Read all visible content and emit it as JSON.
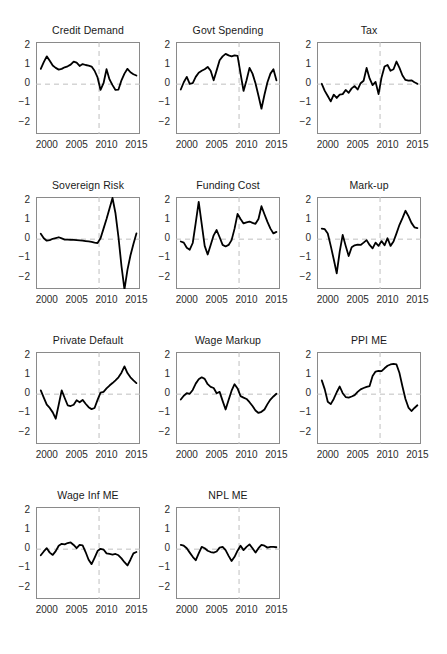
{
  "figure": {
    "type": "small-multiples-line-grid",
    "rows": 4,
    "cols": 3,
    "panel_count": 11,
    "line_color": "#000000",
    "reference_line_color": "#bfbfbf",
    "axis_color": "#8a8a8a",
    "background": "#ffffff"
  },
  "axes": {
    "ylim": [
      -2.6,
      2.2
    ],
    "yticks": [
      2,
      1,
      0,
      -1,
      -2
    ],
    "ytick_labels": [
      "2",
      "1",
      "0",
      "−1",
      "−2"
    ],
    "xlim": [
      1998.2,
      2015.6
    ],
    "xticks": [
      2000,
      2005,
      2010,
      2015
    ],
    "xtick_labels": [
      "2000",
      "2005",
      "2010",
      "2015"
    ],
    "zero_line": 0,
    "vertical_marker_x": 2008.75,
    "grid": false,
    "legend": null
  },
  "chart_data": [
    {
      "type": "line",
      "title": "Credit Demand",
      "xlabel": "",
      "ylabel": "",
      "ylim": [
        -2.6,
        2.2
      ],
      "x": [
        1999,
        1999.5,
        2000,
        2000.5,
        2001,
        2001.5,
        2002,
        2002.5,
        2003,
        2003.5,
        2004,
        2004.5,
        2005,
        2005.5,
        2006,
        2006.5,
        2007,
        2007.5,
        2008,
        2008.5,
        2009,
        2009.5,
        2010,
        2010.5,
        2011,
        2011.5,
        2012,
        2012.5,
        2013,
        2013.5,
        2014,
        2014.5,
        2015
      ],
      "values": [
        0.8,
        1.15,
        1.45,
        1.22,
        0.97,
        0.85,
        0.76,
        0.8,
        0.88,
        0.93,
        1.02,
        1.18,
        1.12,
        0.95,
        1.05,
        1.0,
        0.97,
        0.92,
        0.7,
        0.35,
        -0.3,
        0.05,
        0.78,
        0.25,
        -0.05,
        -0.3,
        -0.28,
        0.2,
        0.55,
        0.8,
        0.62,
        0.52,
        0.45
      ]
    },
    {
      "type": "line",
      "title": "Govt Spending",
      "xlabel": "",
      "ylabel": "",
      "ylim": [
        -2.6,
        2.2
      ],
      "x": [
        1999,
        1999.5,
        2000,
        2000.5,
        2001,
        2001.5,
        2002,
        2002.5,
        2003,
        2003.5,
        2004,
        2004.5,
        2005,
        2005.5,
        2006,
        2006.5,
        2007,
        2007.5,
        2008,
        2008.5,
        2009,
        2009.5,
        2010,
        2010.5,
        2011,
        2011.5,
        2012,
        2012.5,
        2013,
        2013.5,
        2014,
        2014.5,
        2015
      ],
      "values": [
        -0.28,
        0.1,
        0.38,
        0.02,
        0.05,
        0.38,
        0.6,
        0.7,
        0.78,
        0.9,
        0.7,
        0.2,
        0.72,
        1.25,
        1.45,
        1.58,
        1.5,
        1.45,
        1.5,
        1.48,
        0.55,
        -0.35,
        0.2,
        0.85,
        0.55,
        0.05,
        -0.6,
        -1.28,
        -0.55,
        0.1,
        0.55,
        0.78,
        0.2
      ]
    },
    {
      "type": "line",
      "title": "Tax",
      "xlabel": "",
      "ylabel": "",
      "ylim": [
        -2.6,
        2.2
      ],
      "x": [
        1999,
        1999.5,
        2000,
        2000.5,
        2001,
        2001.5,
        2002,
        2002.5,
        2003,
        2003.5,
        2004,
        2004.5,
        2005,
        2005.5,
        2006,
        2006.5,
        2007,
        2007.5,
        2008,
        2008.5,
        2009,
        2009.5,
        2010,
        2010.5,
        2011,
        2011.5,
        2012,
        2012.5,
        2013,
        2013.5,
        2014,
        2014.5,
        2015
      ],
      "values": [
        0.02,
        -0.35,
        -0.62,
        -0.9,
        -0.55,
        -0.72,
        -0.55,
        -0.52,
        -0.3,
        -0.45,
        -0.22,
        -0.1,
        -0.28,
        0.05,
        0.18,
        0.85,
        0.3,
        -0.05,
        0.12,
        -0.52,
        0.35,
        0.92,
        1.0,
        0.7,
        0.78,
        1.18,
        0.85,
        0.45,
        0.22,
        0.18,
        0.2,
        0.1,
        0.02
      ]
    },
    {
      "type": "line",
      "title": "Sovereign Risk",
      "xlabel": "",
      "ylabel": "",
      "ylim": [
        -2.6,
        2.2
      ],
      "x": [
        1999,
        1999.5,
        2000,
        2000.5,
        2001,
        2001.5,
        2002,
        2002.5,
        2003,
        2003.5,
        2004,
        2004.5,
        2005,
        2005.5,
        2006,
        2006.5,
        2007,
        2007.5,
        2008,
        2008.5,
        2009,
        2009.5,
        2010,
        2010.5,
        2011,
        2011.5,
        2012,
        2012.5,
        2013,
        2013.5,
        2014,
        2014.5,
        2015
      ],
      "values": [
        0.28,
        0.05,
        -0.08,
        -0.05,
        0.02,
        0.06,
        0.1,
        0.04,
        -0.02,
        -0.02,
        -0.03,
        -0.04,
        -0.05,
        -0.06,
        -0.08,
        -0.1,
        -0.12,
        -0.14,
        -0.18,
        -0.2,
        0.05,
        0.55,
        1.05,
        1.6,
        2.15,
        1.35,
        0.1,
        -1.4,
        -2.62,
        -1.6,
        -0.85,
        -0.25,
        0.3
      ]
    },
    {
      "type": "line",
      "title": "Funding Cost",
      "xlabel": "",
      "ylabel": "",
      "ylim": [
        -2.6,
        2.2
      ],
      "x": [
        1999,
        1999.5,
        2000,
        2000.5,
        2001,
        2001.5,
        2002,
        2002.5,
        2003,
        2003.5,
        2004,
        2004.5,
        2005,
        2005.5,
        2006,
        2006.5,
        2007,
        2007.5,
        2008,
        2008.5,
        2009,
        2009.5,
        2010,
        2010.5,
        2011,
        2011.5,
        2012,
        2012.5,
        2013,
        2013.5,
        2014,
        2014.5,
        2015
      ],
      "values": [
        -0.12,
        -0.18,
        -0.45,
        -0.55,
        -0.2,
        0.85,
        1.95,
        0.8,
        -0.35,
        -0.8,
        -0.3,
        0.2,
        0.48,
        0.1,
        -0.3,
        -0.38,
        -0.3,
        -0.05,
        0.55,
        1.32,
        1.05,
        0.82,
        0.88,
        0.92,
        0.85,
        0.8,
        1.05,
        1.72,
        1.3,
        0.9,
        0.55,
        0.3,
        0.38
      ]
    },
    {
      "type": "line",
      "title": "Mark-up",
      "xlabel": "",
      "ylabel": "",
      "ylim": [
        -2.6,
        2.2
      ],
      "x": [
        1999,
        1999.5,
        2000,
        2000.5,
        2001,
        2001.5,
        2002,
        2002.5,
        2003,
        2003.5,
        2004,
        2004.5,
        2005,
        2005.5,
        2006,
        2006.5,
        2007,
        2007.5,
        2008,
        2008.5,
        2009,
        2009.5,
        2010,
        2010.5,
        2011,
        2011.5,
        2012,
        2012.5,
        2013,
        2013.5,
        2014,
        2014.5,
        2015
      ],
      "values": [
        0.55,
        0.52,
        0.3,
        -0.35,
        -1.05,
        -1.78,
        -0.65,
        0.22,
        -0.35,
        -0.88,
        -0.42,
        -0.32,
        -0.28,
        -0.3,
        -0.18,
        -0.05,
        -0.3,
        -0.48,
        -0.18,
        -0.35,
        -0.1,
        -0.32,
        0.05,
        -0.35,
        -0.12,
        0.3,
        0.75,
        1.1,
        1.48,
        1.2,
        0.85,
        0.62,
        0.58
      ]
    },
    {
      "type": "line",
      "title": "Private Default",
      "xlabel": "",
      "ylabel": "",
      "ylim": [
        -2.6,
        2.2
      ],
      "x": [
        1999,
        1999.5,
        2000,
        2000.5,
        2001,
        2001.5,
        2002,
        2002.5,
        2003,
        2003.5,
        2004,
        2004.5,
        2005,
        2005.5,
        2006,
        2006.5,
        2007,
        2007.5,
        2008,
        2008.5,
        2009,
        2009.5,
        2010,
        2010.5,
        2011,
        2011.5,
        2012,
        2012.5,
        2013,
        2013.5,
        2014,
        2014.5,
        2015
      ],
      "values": [
        0.2,
        -0.18,
        -0.55,
        -0.72,
        -0.95,
        -1.28,
        -0.55,
        0.2,
        -0.2,
        -0.58,
        -0.62,
        -0.55,
        -0.32,
        -0.42,
        -0.3,
        -0.5,
        -0.68,
        -0.78,
        -0.72,
        -0.3,
        0.08,
        0.12,
        0.3,
        0.45,
        0.58,
        0.72,
        0.88,
        1.12,
        1.45,
        1.1,
        0.88,
        0.72,
        0.58
      ]
    },
    {
      "type": "line",
      "title": "Wage Markup",
      "xlabel": "",
      "ylabel": "",
      "ylim": [
        -2.6,
        2.2
      ],
      "x": [
        1999,
        1999.5,
        2000,
        2000.5,
        2001,
        2001.5,
        2002,
        2002.5,
        2003,
        2003.5,
        2004,
        2004.5,
        2005,
        2005.5,
        2006,
        2006.5,
        2007,
        2007.5,
        2008,
        2008.5,
        2009,
        2009.5,
        2010,
        2010.5,
        2011,
        2011.5,
        2012,
        2012.5,
        2013,
        2013.5,
        2014,
        2014.5,
        2015
      ],
      "values": [
        -0.28,
        -0.08,
        0.05,
        0.02,
        0.22,
        0.55,
        0.78,
        0.88,
        0.8,
        0.52,
        0.38,
        0.32,
        0.05,
        0.12,
        -0.35,
        -0.8,
        -0.3,
        0.18,
        0.52,
        0.3,
        -0.1,
        -0.18,
        -0.25,
        -0.42,
        -0.62,
        -0.85,
        -0.98,
        -0.92,
        -0.8,
        -0.52,
        -0.28,
        -0.12,
        0.02
      ]
    },
    {
      "type": "line",
      "title": "PPI ME",
      "xlabel": "",
      "ylabel": "",
      "ylim": [
        -2.6,
        2.2
      ],
      "x": [
        1999,
        1999.5,
        2000,
        2000.5,
        2001,
        2001.5,
        2002,
        2002.5,
        2003,
        2003.5,
        2004,
        2004.5,
        2005,
        2005.5,
        2006,
        2006.5,
        2007,
        2007.5,
        2008,
        2008.5,
        2009,
        2009.5,
        2010,
        2010.5,
        2011,
        2011.5,
        2012,
        2012.5,
        2013,
        2013.5,
        2014,
        2014.5,
        2015
      ],
      "values": [
        0.72,
        0.25,
        -0.4,
        -0.52,
        -0.25,
        0.1,
        0.4,
        0.05,
        -0.15,
        -0.18,
        -0.12,
        -0.05,
        0.12,
        0.25,
        0.32,
        0.38,
        0.42,
        0.95,
        1.18,
        1.22,
        1.2,
        1.35,
        1.48,
        1.55,
        1.58,
        1.55,
        1.1,
        0.4,
        -0.25,
        -0.7,
        -0.88,
        -0.72,
        -0.58
      ]
    },
    {
      "type": "line",
      "title": "Wage Inf ME",
      "xlabel": "",
      "ylabel": "",
      "ylim": [
        -2.6,
        2.2
      ],
      "x": [
        1999,
        1999.5,
        2000,
        2000.5,
        2001,
        2001.5,
        2002,
        2002.5,
        2003,
        2003.5,
        2004,
        2004.5,
        2005,
        2005.5,
        2006,
        2006.5,
        2007,
        2007.5,
        2008,
        2008.5,
        2009,
        2009.5,
        2010,
        2010.5,
        2011,
        2011.5,
        2012,
        2012.5,
        2013,
        2013.5,
        2014,
        2014.5,
        2015
      ],
      "values": [
        -0.32,
        -0.12,
        0.05,
        -0.18,
        -0.3,
        -0.1,
        0.18,
        0.28,
        0.25,
        0.32,
        0.35,
        0.22,
        0.05,
        0.22,
        0.2,
        -0.15,
        -0.55,
        -0.78,
        -0.45,
        -0.1,
        0.02,
        -0.02,
        -0.22,
        -0.25,
        -0.28,
        -0.25,
        -0.32,
        -0.48,
        -0.68,
        -0.85,
        -0.55,
        -0.22,
        -0.15
      ]
    },
    {
      "type": "line",
      "title": "NPL ME",
      "xlabel": "",
      "ylabel": "",
      "ylim": [
        -2.6,
        2.2
      ],
      "x": [
        1999,
        1999.5,
        2000,
        2000.5,
        2001,
        2001.5,
        2002,
        2002.5,
        2003,
        2003.5,
        2004,
        2004.5,
        2005,
        2005.5,
        2006,
        2006.5,
        2007,
        2007.5,
        2008,
        2008.5,
        2009,
        2009.5,
        2010,
        2010.5,
        2011,
        2011.5,
        2012,
        2012.5,
        2013,
        2013.5,
        2014,
        2014.5,
        2015
      ],
      "values": [
        0.22,
        0.18,
        0.05,
        -0.18,
        -0.4,
        -0.58,
        -0.22,
        0.12,
        0.05,
        -0.08,
        -0.15,
        -0.18,
        -0.12,
        0.08,
        0.12,
        -0.05,
        -0.35,
        -0.62,
        -0.4,
        -0.08,
        0.18,
        -0.05,
        0.12,
        0.25,
        0.05,
        -0.18,
        0.05,
        0.22,
        0.18,
        0.08,
        0.12,
        0.12,
        0.1
      ]
    }
  ]
}
